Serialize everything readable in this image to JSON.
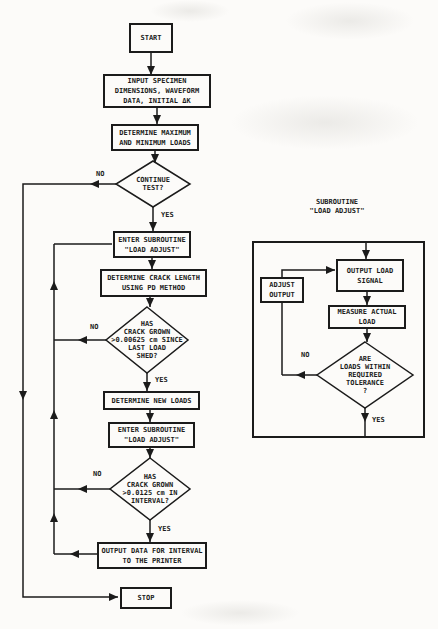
{
  "palette": {
    "ink": "#1b1b1b",
    "paper": "#fcfbf9"
  },
  "main_flow": {
    "start": "START",
    "input_specimen": "INPUT SPECIMEN\nDIMENSIONS, WAVEFORM\nDATA, INITIAL ΔK",
    "determine_loads": "DETERMINE MAXIMUM\nAND MINIMUM LOADS",
    "continue_test": "CONTINUE\nTEST?",
    "enter_subroutine_1": "ENTER SUBROUTINE\n\"LOAD ADJUST\"",
    "determine_crack_length": "DETERMINE CRACK LENGTH\nUSING PD METHOD",
    "crack_grown_since_shed": "HAS\nCRACK GROWN\n>0.00625 cm SINCE\nLAST LOAD\nSHED?",
    "determine_new_loads": "DETERMINE NEW LOADS",
    "enter_subroutine_2": "ENTER SUBROUTINE\n\"LOAD ADJUST\"",
    "crack_grown_interval": "HAS\nCRACK GROWN\n>0.0125 cm IN\nINTERVAL?",
    "output_data": "OUTPUT DATA FOR INTERVAL\nTO THE PRINTER",
    "stop": "STOP"
  },
  "labels": {
    "continue_no": "NO",
    "continue_yes": "YES",
    "shed_no": "NO",
    "shed_yes": "YES",
    "interval_no": "NO",
    "interval_yes": "YES",
    "tolerance_no": "NO",
    "tolerance_yes": "YES"
  },
  "subroutine": {
    "title": "SUBROUTINE\n\"LOAD ADJUST\"",
    "output_load_signal": "OUTPUT LOAD\nSIGNAL",
    "adjust_output": "ADJUST\nOUTPUT",
    "measure_actual_load": "MEASURE ACTUAL\nLOAD",
    "loads_within_tolerance": "ARE\nLOADS WITHIN\nREQUIRED\nTOLERANCE\n?"
  }
}
